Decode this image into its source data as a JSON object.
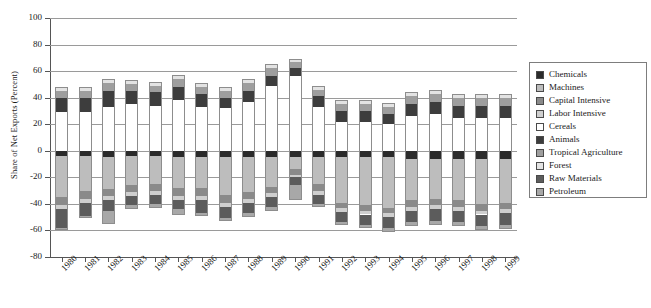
{
  "chart_data": {
    "type": "bar",
    "stacked": true,
    "title": "",
    "xlabel": "",
    "ylabel": "Share of Net Exports (Percent)",
    "ylim": [
      -80,
      100
    ],
    "yticks": [
      100,
      80,
      60,
      40,
      20,
      0,
      -20,
      -40,
      -60,
      -80
    ],
    "ytick_labels": [
      "100",
      "80",
      "60",
      "40",
      "20",
      "0",
      "-20",
      "-40",
      "-60",
      "-80"
    ],
    "grid": true,
    "legend_position": "right",
    "categories": [
      "1980",
      "1981",
      "1982",
      "1983",
      "1984",
      "1985",
      "1986",
      "1987",
      "1988",
      "1989",
      "1990",
      "1991",
      "1992",
      "1993",
      "1994",
      "1995",
      "1996",
      "1997",
      "1998",
      "1999"
    ],
    "series": [
      {
        "name": "Chemicals",
        "color": "#2b2b2b",
        "values": [
          -4,
          -4,
          -5,
          -4,
          -4,
          -5,
          -5,
          -5,
          -5,
          -5,
          -5,
          -5,
          -5,
          -5,
          -5,
          -6,
          -6,
          -6,
          -6,
          -6
        ]
      },
      {
        "name": "Machines",
        "color": "#bdbdbd",
        "values": [
          -31,
          -26,
          -24,
          -22,
          -21,
          -23,
          -23,
          -28,
          -26,
          -22,
          -9,
          -20,
          -34,
          -36,
          -38,
          -31,
          -30,
          -31,
          -34,
          -33
        ]
      },
      {
        "name": "Capital Intensive",
        "color": "#8a8a8a",
        "values": [
          -6,
          -6,
          -5,
          -5,
          -5,
          -6,
          -6,
          -6,
          -5,
          -5,
          -4,
          -5,
          -4,
          -4,
          -4,
          -5,
          -5,
          -5,
          -5,
          -5
        ]
      },
      {
        "name": "Labor Intensive",
        "color": "#cfcfcf",
        "values": [
          -3,
          -3,
          -3,
          -3,
          -3,
          -3,
          -3,
          -3,
          -3,
          -3,
          -2,
          -3,
          -3,
          -3,
          -3,
          -3,
          -3,
          -3,
          -3,
          -3
        ]
      },
      {
        "name": "Cereals",
        "color": "#ffffff",
        "values": [
          29,
          29,
          33,
          35,
          34,
          38,
          33,
          32,
          37,
          49,
          56,
          33,
          22,
          22,
          20,
          26,
          28,
          25,
          25,
          25
        ]
      },
      {
        "name": "Animals",
        "color": "#3d3d3d",
        "values": [
          11,
          11,
          12,
          10,
          10,
          10,
          10,
          8,
          8,
          7,
          6,
          8,
          8,
          8,
          8,
          9,
          9,
          9,
          9,
          9
        ]
      },
      {
        "name": "Tropical Agriculture",
        "color": "#9e9e9e",
        "values": [
          5,
          5,
          6,
          5,
          5,
          6,
          5,
          5,
          6,
          6,
          5,
          5,
          5,
          5,
          5,
          6,
          6,
          6,
          6,
          6
        ]
      },
      {
        "name": "Forest",
        "color": "#e3e3e3",
        "values": [
          3,
          3,
          3,
          3,
          3,
          3,
          3,
          3,
          3,
          3,
          2,
          3,
          3,
          3,
          3,
          3,
          3,
          3,
          3,
          3
        ]
      },
      {
        "name": "Raw Materials",
        "color": "#5c5c5c",
        "values": [
          -14,
          -10,
          -8,
          -7,
          -7,
          -7,
          -10,
          -9,
          -8,
          -7,
          -6,
          -7,
          -8,
          -8,
          -8,
          -9,
          -9,
          -9,
          -9,
          -9
        ]
      },
      {
        "name": "Petroleum",
        "color": "#a8a8a8",
        "values": [
          -2,
          -2,
          -10,
          -3,
          -3,
          -4,
          -2,
          -2,
          -3,
          -3,
          -11,
          -2,
          -2,
          -2,
          -3,
          -3,
          -3,
          -3,
          -3,
          -3
        ]
      }
    ]
  },
  "legend": {
    "items": [
      {
        "label": "Chemicals",
        "color": "#2b2b2b"
      },
      {
        "label": "Machines",
        "color": "#bdbdbd"
      },
      {
        "label": "Capital Intensive",
        "color": "#8a8a8a"
      },
      {
        "label": "Labor Intensive",
        "color": "#cfcfcf"
      },
      {
        "label": "Cereals",
        "color": "#ffffff"
      },
      {
        "label": "Animals",
        "color": "#3d3d3d"
      },
      {
        "label": "Tropical Agriculture",
        "color": "#9e9e9e"
      },
      {
        "label": "Forest",
        "color": "#e3e3e3"
      },
      {
        "label": "Raw Materials",
        "color": "#5c5c5c"
      },
      {
        "label": "Petroleum",
        "color": "#a8a8a8"
      }
    ]
  }
}
